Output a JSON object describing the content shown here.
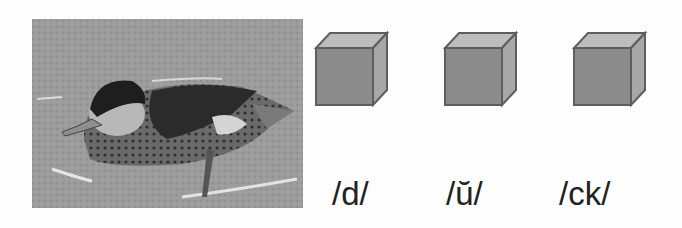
{
  "image": {
    "subject": "duck",
    "alt": "Photo of a duck resting on water"
  },
  "cubes": [
    {
      "id": 1,
      "sound": "/d/",
      "left": 314
    },
    {
      "id": 2,
      "sound": "/ŭ/",
      "left": 443
    },
    {
      "id": 3,
      "sound": "/ck/",
      "left": 572
    }
  ],
  "labels": [
    "/d/",
    "/ŭ/",
    "/ck/"
  ],
  "colors": {
    "cube_front": "#8c8c8c",
    "cube_top": "#bdbdbd",
    "cube_side": "#a8a8a8",
    "cube_outline": "#5e5e5e"
  }
}
